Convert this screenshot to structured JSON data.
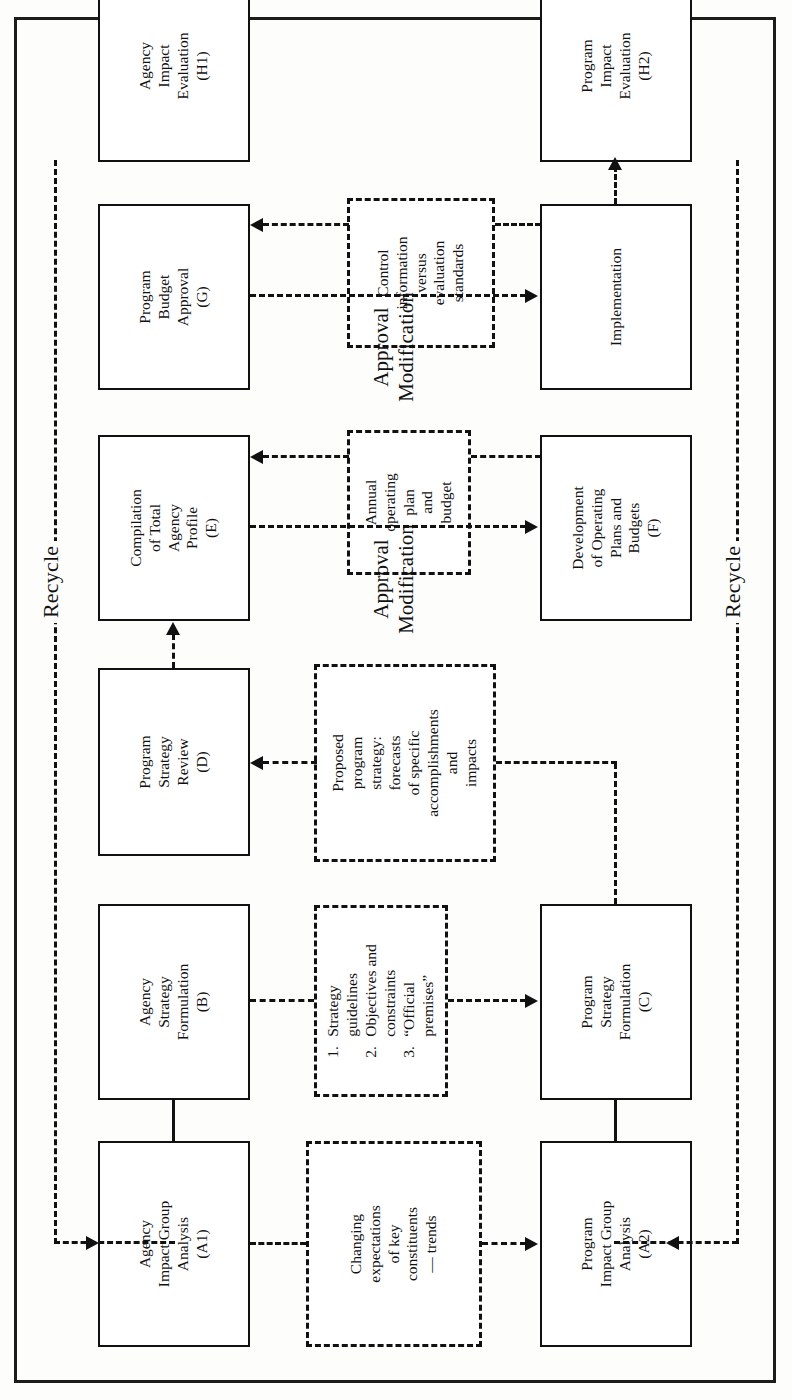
{
  "diagram": {
    "orientation": "rotated-90-ccw",
    "recycle_left_label": "Recycle",
    "recycle_right_label": "Recycle",
    "approval_label_upper": "Approval\nModification",
    "approval_label_lower": "Approval\nModification",
    "nodes": {
      "a1": "Agency\nImpact Group\nAnalysis\n(A1)",
      "b": "Agency\nStrategy\nFormulation\n(B)",
      "d": "Program\nStrategy\nReview\n(D)",
      "e": "Compilation\nof Total\nAgency\nProfile\n(E)",
      "g": "Program\nBudget\nApproval\n(G)",
      "h1": "Agency\nImpact\nEvaluation\n(H1)",
      "a2": "Program\nImpact Group\nAnalysis\n(A2)",
      "c": "Program\nStrategy\nFormulation\n(C)",
      "f": "Development\nof Operating\nPlans and\nBudgets\n(F)",
      "implementation": "Implementation",
      "h2": "Program\nImpact\nEvaluation\n(H2)"
    },
    "artifacts": {
      "changing_expectations": "Changing\nexpectations\nof key\nconstituents\n— trends",
      "strategy_guidelines_items": [
        {
          "num": "1.",
          "text": "Strategy\nguidelines"
        },
        {
          "num": "2.",
          "text": "Objectives and\nconstraints"
        },
        {
          "num": "3.",
          "text": "“Official\npremises”"
        }
      ],
      "proposed_program_strategy": "Proposed\nprogram\nstrategy:\nforecasts\nof specific\naccomplishments\nand\nimpacts",
      "annual_operating_plan": "Annual\noperating\nplan\nand\nbudget",
      "control_information": "Control\ninformation\nversus\nevaluation\nstandards"
    },
    "colors": {
      "ink": "#111111",
      "paper": "#fdfdfc",
      "frame": "#1c1c1c"
    }
  }
}
